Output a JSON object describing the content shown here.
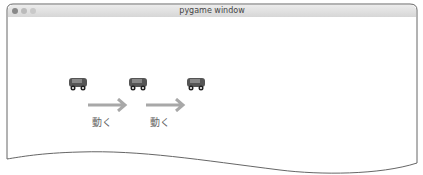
{
  "window": {
    "title": "pygame window",
    "buttons": [
      "close",
      "minimize",
      "zoom"
    ]
  },
  "scene": {
    "cars": [
      {
        "x": 68,
        "y": 74
      },
      {
        "x": 128,
        "y": 74
      },
      {
        "x": 186,
        "y": 74
      }
    ],
    "arrows": [
      {
        "x": 86,
        "y": 97
      },
      {
        "x": 144,
        "y": 97
      }
    ],
    "labels": [
      {
        "text": "動く",
        "x": 92,
        "y": 115
      },
      {
        "text": "動く",
        "x": 150,
        "y": 115
      }
    ],
    "colors": {
      "car_body": "#555555",
      "arrow": "#a8a8a8",
      "frame": "#666666"
    }
  }
}
